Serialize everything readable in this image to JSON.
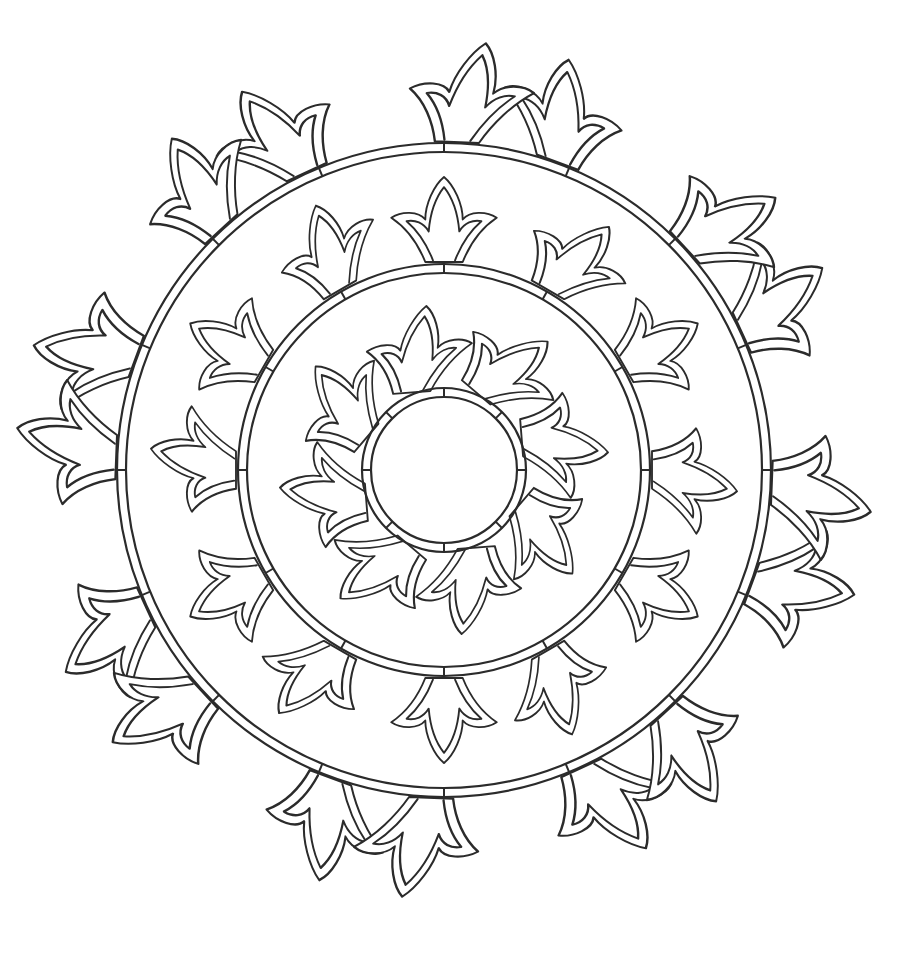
{
  "artwork": {
    "type": "mandala-coloring-page",
    "background": "#ffffff",
    "line_color": "#2b2b2b",
    "center": [
      444,
      470
    ],
    "rings": [
      {
        "name": "outer-ring",
        "r_outer": 327,
        "r_inner": 318,
        "ticks": 16
      },
      {
        "name": "middle-ring",
        "r_outer": 206,
        "r_inner": 197,
        "ticks": 12
      },
      {
        "name": "center-ring",
        "r_outer": 82,
        "r_inner": 73,
        "ticks": 8
      }
    ],
    "motif_bands": [
      {
        "name": "outer-tulip-band",
        "count": 16,
        "base_radius": 328,
        "scale": 1.0,
        "pairing": "mirrored-pairs",
        "offset_deg": 0
      },
      {
        "name": "middle-tulip-band",
        "count": 12,
        "base_radius": 208,
        "scale": 0.85,
        "pairing": "radial",
        "offset_deg": 0
      },
      {
        "name": "inner-pinwheel-band",
        "count": 8,
        "base_radius": 84,
        "scale": 0.85,
        "pairing": "swirl",
        "offset_deg": 22.5
      }
    ]
  }
}
